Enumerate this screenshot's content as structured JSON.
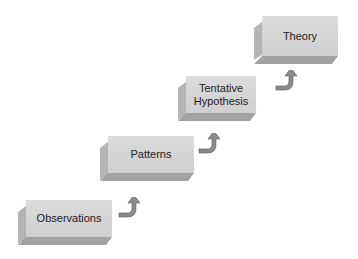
{
  "diagram": {
    "steps": [
      {
        "label": "Observations"
      },
      {
        "label": "Patterns"
      },
      {
        "label": "Tentative Hypothesis"
      },
      {
        "label": "Theory"
      }
    ],
    "colors": {
      "box_front": "#d6d6d6",
      "box_side": "#b4b4b4",
      "box_bottom": "#a2a2a2",
      "arrow": "#8a8a8a"
    }
  }
}
